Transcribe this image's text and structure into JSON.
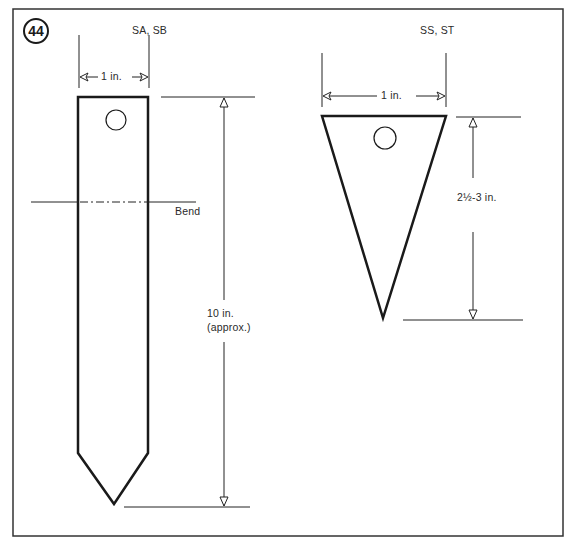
{
  "figure": {
    "number": "44",
    "frame_color": "#333333"
  },
  "stake_long": {
    "models": "SA, SB",
    "width_label": "1 in.",
    "length_label_line1": "10 in.",
    "length_label_line2": "(approx.)",
    "bend_label": "Bend"
  },
  "stake_short": {
    "models": "SS, ST",
    "width_label": "1 in.",
    "length_label": "2½-3 in."
  }
}
